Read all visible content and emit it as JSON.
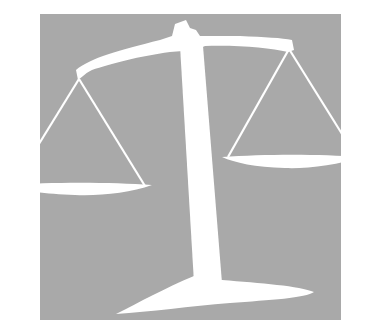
{
  "image": {
    "subject": "balance scale silhouette on gray square",
    "alt": "Scales of justice clip art",
    "colors": {
      "background": "#ffffff",
      "square": "#a9a9a9",
      "scale": "#ffffff"
    }
  }
}
